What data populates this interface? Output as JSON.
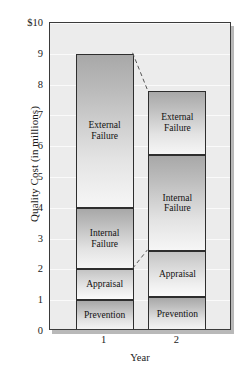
{
  "chart_data": {
    "type": "bar",
    "subtype": "stacked-bar",
    "title": "",
    "xlabel": "Year",
    "ylabel": "Quality Cost (in millions)",
    "categories": [
      "1",
      "2"
    ],
    "ylim": [
      0,
      10
    ],
    "ytick_labels": [
      "0",
      "1",
      "2",
      "3",
      "4",
      "5",
      "6",
      "7",
      "8",
      "9",
      "$10"
    ],
    "ytick_values": [
      0,
      1,
      2,
      3,
      4,
      5,
      6,
      7,
      8,
      9,
      10
    ],
    "grid": false,
    "legend": false,
    "series": [
      {
        "name": "Prevention",
        "values": [
          1.0,
          1.1
        ]
      },
      {
        "name": "Appraisal",
        "values": [
          1.0,
          1.5
        ]
      },
      {
        "name": "Internal Failure",
        "values": [
          2.0,
          3.1
        ]
      },
      {
        "name": "External Failure",
        "values": [
          5.0,
          2.1
        ]
      }
    ],
    "stack_boundaries": {
      "1": [
        0,
        1.0,
        2.0,
        4.0,
        9.0
      ],
      "2": [
        0,
        1.1,
        2.6,
        5.7,
        7.8
      ]
    },
    "totals": [
      9.0,
      7.8
    ],
    "connectors": [
      {
        "from_year": "1",
        "from_value": 9.0,
        "to_year": "2",
        "to_value": 7.8,
        "style": "dashed"
      },
      {
        "from_year": "1",
        "from_value": 2.0,
        "to_year": "2",
        "to_value": 2.6,
        "style": "dashed"
      }
    ],
    "colors": {
      "plot_background": "#ececec",
      "frame": "#3a3a3a",
      "shadow": "#b9b9b9",
      "segment_fill_dark": "#a8a8a8",
      "segment_fill_light": "#f6f6f6",
      "text": "#111111"
    }
  },
  "bars": [
    {
      "category": "1",
      "segments": [
        {
          "label": "External Failure",
          "label_line1": "External",
          "label_line2": "Failure",
          "low": 4.0,
          "high": 9.0,
          "shade": "dark"
        },
        {
          "label": "Internal Failure",
          "label_line1": "Internal",
          "label_line2": "Failure",
          "low": 2.0,
          "high": 4.0,
          "shade": "dark"
        },
        {
          "label": "Appraisal",
          "label_line1": "Appraisal",
          "label_line2": "",
          "low": 1.0,
          "high": 2.0,
          "shade": "light"
        },
        {
          "label": "Prevention",
          "label_line1": "Prevention",
          "label_line2": "",
          "low": 0.0,
          "high": 1.0,
          "shade": "dark"
        }
      ]
    },
    {
      "category": "2",
      "segments": [
        {
          "label": "External Failure",
          "label_line1": "External",
          "label_line2": "Failure",
          "low": 5.7,
          "high": 7.8,
          "shade": "dark"
        },
        {
          "label": "Internal Failure",
          "label_line1": "Internal",
          "label_line2": "Failure",
          "low": 2.6,
          "high": 5.7,
          "shade": "dark"
        },
        {
          "label": "Appraisal",
          "label_line1": "Appraisal",
          "label_line2": "",
          "low": 1.1,
          "high": 2.6,
          "shade": "light"
        },
        {
          "label": "Prevention",
          "label_line1": "Prevention",
          "label_line2": "",
          "low": 0.0,
          "high": 1.1,
          "shade": "dark"
        }
      ]
    }
  ]
}
